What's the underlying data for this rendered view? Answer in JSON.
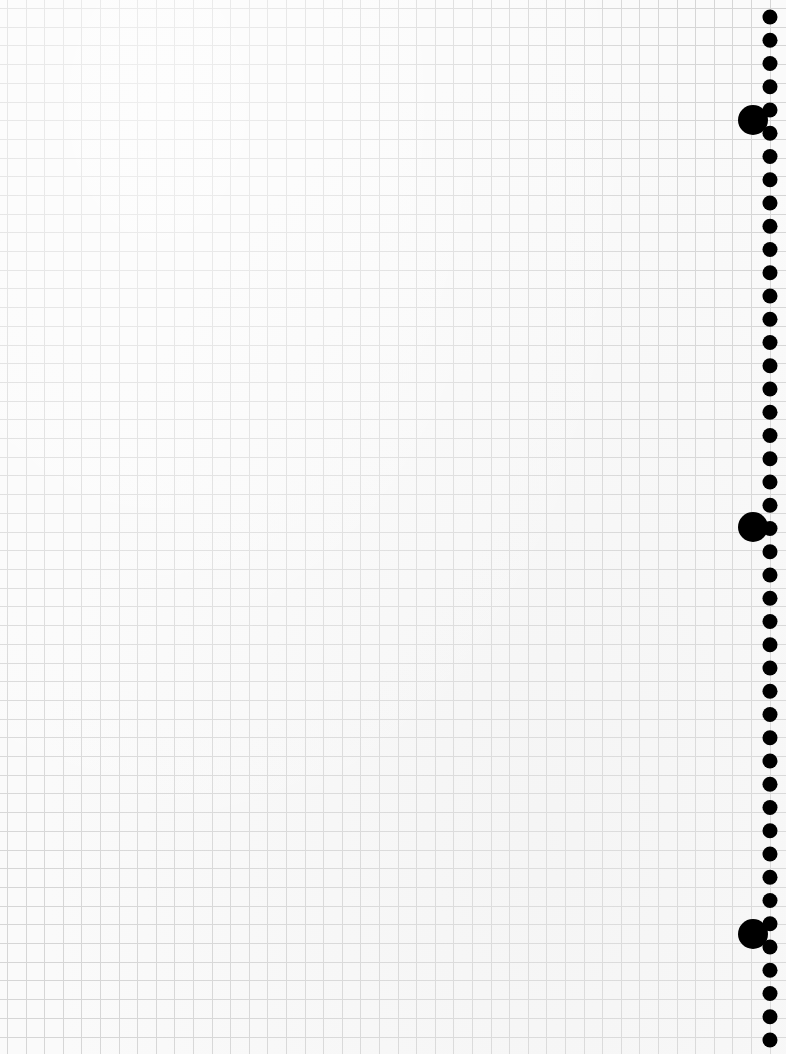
{
  "sheet": {
    "width": 786,
    "height": 1054,
    "background": "#fafafa"
  },
  "grid": {
    "origin_x": 7,
    "origin_y": 8,
    "spacing_x": 18.6,
    "spacing_y": 18.7,
    "line_color": "#d6d6d6",
    "line_width": 1
  },
  "perforation": {
    "small_holes": {
      "cx": 770,
      "start_y": 17,
      "pitch": 23.25,
      "count": 45,
      "radius": 7.5,
      "color": "#000000"
    },
    "large_holes": [
      {
        "cx": 753,
        "cy": 120,
        "r": 15
      },
      {
        "cx": 753,
        "cy": 527,
        "r": 15
      },
      {
        "cx": 753,
        "cy": 934,
        "r": 15
      }
    ],
    "large_hole_color": "#000000"
  }
}
